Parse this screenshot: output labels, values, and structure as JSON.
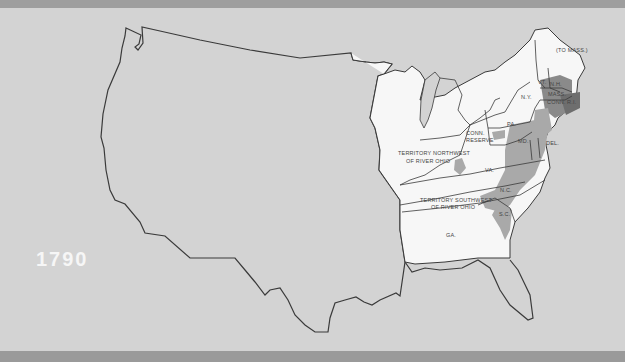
{
  "map": {
    "year": "1790",
    "colors": {
      "background": "#d3d3d3",
      "border_band": "#9c9c9c",
      "territory_fill": "#f7f7f7",
      "settled_fill": "#a9a9a9",
      "dense_fill": "#777777",
      "outline": "#3a3a3a",
      "year_text": "#f6f6f6"
    },
    "labels": {
      "maine": "(TO MASS.)",
      "vermont": "VT.",
      "new_hampshire": "N.H.",
      "massachusetts": "MASS.",
      "connecticut": "CONN.",
      "rhode_island": "R.I.",
      "new_york": "N.Y.",
      "pennsylvania": "PA.",
      "conn_reserve_1": "CONN.",
      "conn_reserve_2": "RESERVE",
      "nw_territory_1": "TERRITORY NORTHWEST",
      "nw_territory_2": "OF RIVER OHIO",
      "virginia": "VA.",
      "maryland": "MD.",
      "delaware": "DEL.",
      "sw_territory_1": "TERRITORY SOUTHWEST",
      "sw_territory_2": "OF RIVER OHIO",
      "north_carolina": "N.C.",
      "south_carolina": "S.C.",
      "georgia": "GA."
    }
  }
}
